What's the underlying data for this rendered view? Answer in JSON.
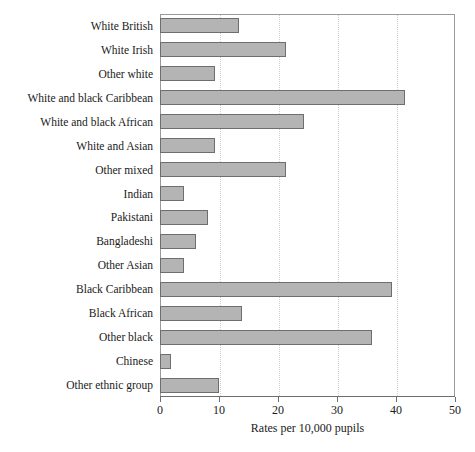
{
  "chart_data": {
    "type": "bar",
    "orientation": "horizontal",
    "title": "",
    "xlabel": "Rates per 10,000 pupils",
    "ylabel": "",
    "xlim": [
      0,
      50
    ],
    "xticks": [
      0,
      10,
      20,
      30,
      40,
      50
    ],
    "grid": true,
    "grid_axis": "x",
    "legend": "none",
    "bar_color": "#b4b4b4",
    "bar_edge_color": "#6e6e6e",
    "categories": [
      "White British",
      "White Irish",
      "Other white",
      "White and black Caribbean",
      "White and black African",
      "White and Asian",
      "Other mixed",
      "Indian",
      "Pakistani",
      "Bangladeshi",
      "Other Asian",
      "Black Caribbean",
      "Black African",
      "Other black",
      "Chinese",
      "Other ethnic group"
    ],
    "values": [
      13.4,
      21.4,
      9.3,
      41.5,
      24.4,
      9.3,
      21.4,
      4.1,
      8.1,
      6.1,
      4.1,
      39.3,
      13.9,
      35.9,
      1.9,
      10.0
    ]
  }
}
